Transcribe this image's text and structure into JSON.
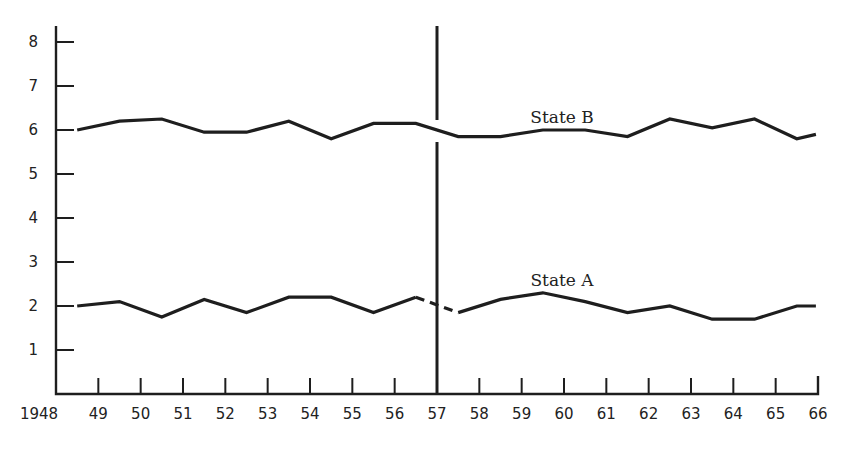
{
  "chart_data": {
    "type": "line",
    "title": "",
    "xlabel": "",
    "ylabel": "",
    "x_tick_labels": [
      "1948",
      "49",
      "50",
      "51",
      "52",
      "53",
      "54",
      "55",
      "56",
      "57",
      "58",
      "59",
      "60",
      "61",
      "62",
      "63",
      "64",
      "65",
      "66"
    ],
    "x_tick_values": [
      1948,
      1949,
      1950,
      1951,
      1952,
      1953,
      1954,
      1955,
      1956,
      1957,
      1958,
      1959,
      1960,
      1961,
      1962,
      1963,
      1964,
      1965,
      1966
    ],
    "y_tick_labels": [
      "1",
      "2",
      "3",
      "4",
      "5",
      "6",
      "7",
      "8"
    ],
    "y_tick_values": [
      1,
      2,
      3,
      4,
      5,
      6,
      7,
      8
    ],
    "xlim": [
      1948,
      1966
    ],
    "ylim": [
      0,
      8.6
    ],
    "grid": false,
    "legend": "inline labels",
    "annotations": [
      {
        "type": "vertical_line",
        "x": 1957,
        "note": "break at State B crossing"
      },
      {
        "type": "dashed_segment",
        "series": "State A",
        "from": 1956.5,
        "to": 1957.5
      }
    ],
    "x": [
      1948.5,
      1949.5,
      1950.5,
      1951.5,
      1952.5,
      1953.5,
      1954.5,
      1955.5,
      1956.5,
      1957.5,
      1958.5,
      1959.5,
      1960.5,
      1961.5,
      1962.5,
      1963.5,
      1964.5,
      1965.5,
      1965.95
    ],
    "series": [
      {
        "name": "State B",
        "label_position": {
          "x": 1959.5,
          "y": 6.55
        },
        "values": [
          6.0,
          6.2,
          6.25,
          5.95,
          5.95,
          6.2,
          5.8,
          6.15,
          6.15,
          5.85,
          5.85,
          6.0,
          6.0,
          5.85,
          6.25,
          6.05,
          6.25,
          5.8,
          5.9
        ]
      },
      {
        "name": "State A",
        "label_position": {
          "x": 1959.5,
          "y": 2.6
        },
        "values": [
          2.0,
          2.1,
          1.75,
          2.15,
          1.85,
          2.2,
          2.2,
          1.85,
          2.2,
          1.85,
          2.15,
          2.3,
          2.1,
          1.85,
          2.0,
          1.7,
          1.7,
          2.0,
          2.0
        ]
      }
    ]
  },
  "labels": {
    "state_b": "State B",
    "state_a": "State A"
  },
  "colors": {
    "line": "#1e1e1e",
    "text": "#222222",
    "background": "#ffffff"
  }
}
